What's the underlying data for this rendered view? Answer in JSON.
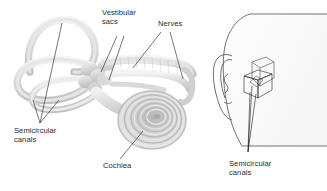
{
  "figure": {
    "background_color": "#ffffff",
    "text_color": "#2b2b2b",
    "line_color": "#1a1a1a",
    "anatomy_fill_light": "#ededed",
    "anatomy_fill_mid": "#d4d4d4",
    "anatomy_fill_dark": "#b0b0b0",
    "head_outline_color": "#555555",
    "head_fill": "#fbfbfb"
  },
  "labels": {
    "vestibular_sacs": "Vestibular\nsacs",
    "nerves": "Nerves",
    "semicircular_canals_left": "Semicircular\ncanals",
    "cochlea": "Cochlea",
    "semicircular_canals_right": "Semicircular\ncanals"
  },
  "diagram_parts": {
    "left_panel": [
      "semicircular-canal-superior",
      "semicircular-canal-posterior",
      "semicircular-canal-lateral",
      "vestibule",
      "vestibular-sacs",
      "vestibulocochlear-nerve",
      "cochlea-spiral"
    ],
    "right_panel": [
      "head-profile",
      "pinna-outline",
      "orientation-box",
      "inner-ear-marker"
    ]
  }
}
